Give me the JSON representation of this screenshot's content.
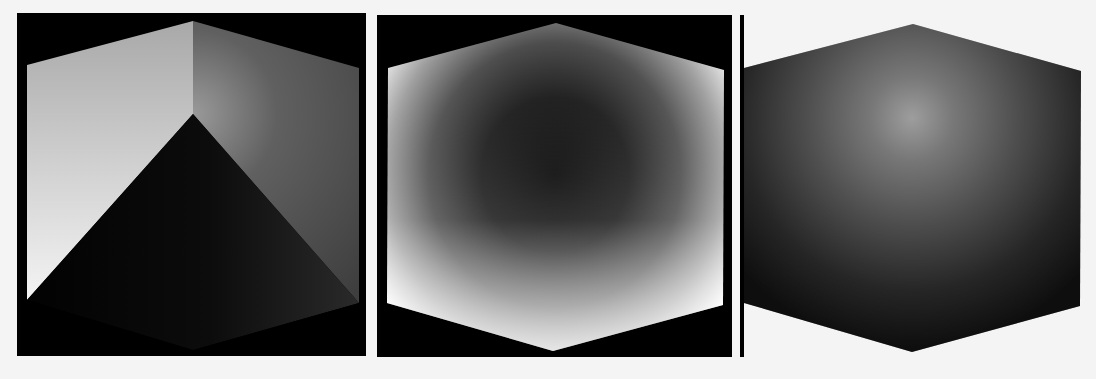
{
  "figure": {
    "background": "#f4f4f4",
    "panels": [
      {
        "id": "panel-1",
        "description": "cube rendering with hard shadow edge from center vertex",
        "frame_bg": "#000000",
        "box": {
          "x": 17,
          "y": 13,
          "w": 349,
          "h": 343
        },
        "vertices": {
          "top": [
            193,
            21
          ],
          "top_left": [
            27,
            65
          ],
          "top_right": [
            359,
            68
          ],
          "center": [
            193,
            114
          ],
          "bottom_left": [
            27,
            300
          ],
          "bottom_right": [
            359,
            303
          ]
        },
        "colors": {
          "lit": "#f0f0f0",
          "mid": "#9a9a9a",
          "dark": "#1a1a1a",
          "shade": "#3c3c3c"
        }
      },
      {
        "id": "panel-2",
        "description": "cube with bright edges and dark interior (edge-glow / inverse shading)",
        "frame_bg": "#000000",
        "box": {
          "x": 377,
          "y": 15,
          "w": 355,
          "h": 342
        },
        "vertices": {
          "top": [
            556,
            23
          ],
          "top_left": [
            388,
            68
          ],
          "top_right": [
            724,
            70
          ],
          "bottom_left": [
            387,
            303
          ],
          "bottom_right": [
            723,
            305
          ],
          "bottom": [
            553,
            351
          ]
        },
        "colors": {
          "edge": "#ffffff",
          "core": "#000000"
        }
      },
      {
        "id": "panel-3",
        "description": "cube with glowing highlight at front vertex, dark silhouette edges",
        "frame_bg": "none",
        "vertices": {
          "top": [
            913,
            24
          ],
          "top_left": [
            744,
            68
          ],
          "top_right": [
            1081,
            71
          ],
          "center": [
            912,
            118
          ],
          "bottom_left": [
            744,
            303
          ],
          "bottom_right": [
            1080,
            306
          ],
          "bottom": [
            912,
            352
          ]
        },
        "colors": {
          "highlight": "#f2f2f2",
          "mid": "#8a8a8a",
          "edge": "#151515"
        }
      }
    ]
  }
}
